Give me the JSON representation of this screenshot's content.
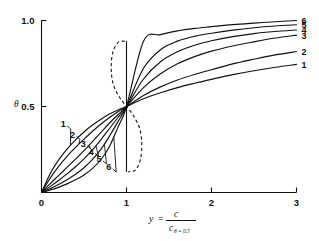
{
  "figure": {
    "background": "#ffffff",
    "ink_color": "#111111"
  },
  "axes": {
    "y_axis": {
      "label_symbol": "θ",
      "ticks": [
        {
          "value": 0.5,
          "label": "0.5"
        },
        {
          "value": 1.0,
          "label": "1.0"
        }
      ],
      "range": [
        0,
        1.06
      ]
    },
    "x_axis": {
      "label_lead": "y",
      "label_equals": "=",
      "label_numerator": "c",
      "label_denominator_base": "c",
      "label_denominator_sub": "θ = 0.5",
      "ticks": [
        {
          "value": 0,
          "label": "0"
        },
        {
          "value": 1,
          "label": "1"
        },
        {
          "value": 2,
          "label": "2"
        },
        {
          "value": 3,
          "label": "3"
        }
      ],
      "range": [
        0,
        3
      ]
    }
  },
  "curve_labels_right": [
    "6",
    "5",
    "4",
    "3",
    "2",
    "1"
  ],
  "curve_labels_left": [
    "1",
    "2",
    "3",
    "4",
    "5",
    "6"
  ],
  "chart_data": {
    "type": "line",
    "title": "",
    "xlabel": "y = c / c(θ = 0.5)",
    "ylabel": "θ",
    "xlim": [
      0,
      3
    ],
    "ylim": [
      0,
      1.06
    ],
    "grid": false,
    "legend": "curve numbers 1-6 labelled at both ends of each curve",
    "crossing_point": {
      "x": 1,
      "y": 0.5
    },
    "annotations": [
      {
        "text": "dashed S-shaped envelope through the common crossing point (1, 0.5)"
      }
    ],
    "x": [
      0,
      0.1,
      0.2,
      0.3,
      0.4,
      0.5,
      0.6,
      0.7,
      0.8,
      0.9,
      1.0,
      1.2,
      1.4,
      1.6,
      1.8,
      2.0,
      2.25,
      2.5,
      2.75,
      3.0
    ],
    "series": [
      {
        "name": "1",
        "label_right": "1",
        "label_left": "1",
        "values": [
          0,
          0.108,
          0.188,
          0.252,
          0.306,
          0.352,
          0.392,
          0.426,
          0.456,
          0.48,
          0.5,
          0.545,
          0.58,
          0.61,
          0.635,
          0.658,
          0.685,
          0.708,
          0.728,
          0.745
        ]
      },
      {
        "name": "2",
        "label_right": "2",
        "label_left": "2",
        "values": [
          0,
          0.082,
          0.15,
          0.21,
          0.262,
          0.31,
          0.356,
          0.398,
          0.436,
          0.47,
          0.5,
          0.564,
          0.614,
          0.654,
          0.686,
          0.714,
          0.748,
          0.775,
          0.8,
          0.82
        ]
      },
      {
        "name": "3",
        "label_right": "3",
        "label_left": "3",
        "values": [
          0,
          0.05,
          0.098,
          0.146,
          0.194,
          0.244,
          0.296,
          0.35,
          0.404,
          0.452,
          0.5,
          0.61,
          0.69,
          0.748,
          0.79,
          0.822,
          0.852,
          0.876,
          0.898,
          0.915
        ]
      },
      {
        "name": "4",
        "label_right": "4",
        "label_left": "4",
        "values": [
          0,
          0.034,
          0.07,
          0.108,
          0.15,
          0.196,
          0.248,
          0.308,
          0.372,
          0.436,
          0.5,
          0.66,
          0.76,
          0.818,
          0.856,
          0.882,
          0.906,
          0.924,
          0.936,
          0.945
        ]
      },
      {
        "name": "5",
        "label_right": "5",
        "label_left": "5",
        "values": [
          0,
          0.022,
          0.046,
          0.074,
          0.106,
          0.144,
          0.192,
          0.252,
          0.328,
          0.412,
          0.5,
          0.722,
          0.83,
          0.88,
          0.908,
          0.926,
          0.944,
          0.958,
          0.968,
          0.975
        ]
      },
      {
        "name": "6",
        "label_right": "6",
        "label_left": "6",
        "values": [
          0,
          0.014,
          0.03,
          0.05,
          0.074,
          0.102,
          0.14,
          0.192,
          0.268,
          0.38,
          0.5,
          0.88,
          0.918,
          0.94,
          0.954,
          0.964,
          0.976,
          0.985,
          0.993,
          1.0
        ]
      }
    ],
    "envelope": {
      "name": "dashed-envelope",
      "style": "dashed",
      "x": [
        0.98,
        0.9,
        0.838,
        0.82,
        0.845,
        0.92,
        1.0,
        1.08,
        1.155,
        1.18,
        1.162,
        1.1,
        1.02
      ],
      "y": [
        0.88,
        0.872,
        0.812,
        0.72,
        0.628,
        0.552,
        0.5,
        0.448,
        0.372,
        0.28,
        0.188,
        0.128,
        0.12
      ]
    },
    "vertical_segment": {
      "name": "vertical-line-at-y-1",
      "x": 1.0,
      "y_from": 0.12,
      "y_to": 0.88
    }
  }
}
